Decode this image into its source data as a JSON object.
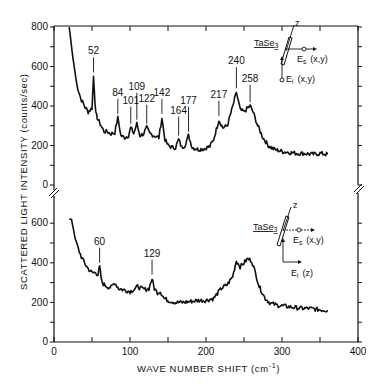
{
  "chart_data": {
    "type": "line",
    "title": "",
    "xlabel": "WAVE NUMBER SHIFT (cm⁻¹)",
    "ylabel": "SCATTERED LIGHT INTENSITY (counts/sec)",
    "xlim": [
      0,
      400
    ],
    "x_ticks": [
      0,
      100,
      200,
      300,
      400
    ],
    "grid": false,
    "legend": "none",
    "panels": [
      {
        "name": "top",
        "ylim": [
          0,
          800
        ],
        "y_ticks": [
          0,
          200,
          400,
          600,
          800
        ],
        "inset": {
          "sample": "TaSe3",
          "axis_label": "z",
          "scattered": "Es (x,y)",
          "incident": "Ei (x,y)"
        },
        "peak_labels": [
          52,
          84,
          101,
          109,
          122,
          142,
          164,
          177,
          217,
          240,
          258
        ],
        "series": {
          "name": "TaSe3 Ei(x,y) Es(x,y)",
          "x": [
            20,
            25,
            30,
            35,
            40,
            45,
            50,
            52,
            55,
            58,
            62,
            66,
            70,
            75,
            80,
            84,
            88,
            93,
            98,
            101,
            105,
            109,
            113,
            118,
            122,
            126,
            132,
            138,
            142,
            146,
            150,
            156,
            160,
            164,
            168,
            172,
            177,
            182,
            190,
            198,
            205,
            210,
            217,
            222,
            228,
            234,
            240,
            245,
            250,
            255,
            258,
            262,
            268,
            275,
            282,
            290,
            300,
            310,
            320,
            330,
            340,
            350,
            360
          ],
          "y": [
            800,
            640,
            510,
            440,
            400,
            370,
            390,
            550,
            360,
            330,
            300,
            270,
            270,
            260,
            265,
            340,
            250,
            240,
            250,
            290,
            260,
            310,
            250,
            260,
            290,
            260,
            250,
            240,
            340,
            230,
            200,
            190,
            190,
            230,
            190,
            200,
            250,
            190,
            180,
            185,
            195,
            230,
            330,
            290,
            300,
            380,
            470,
            380,
            370,
            390,
            400,
            370,
            300,
            240,
            200,
            180,
            170,
            165,
            160,
            160,
            155,
            160,
            155
          ]
        }
      },
      {
        "name": "bottom",
        "ylim": [
          0,
          600
        ],
        "y_ticks": [
          0,
          200,
          400,
          600
        ],
        "inset": {
          "sample": "TaSe3",
          "axis_label": "z",
          "scattered": "Es (x,y)",
          "incident": "Ei (z)"
        },
        "peak_labels": [
          60,
          129
        ],
        "series": {
          "name": "TaSe3 Ei(z) Es(x,y)",
          "x": [
            20,
            22,
            25,
            28,
            32,
            36,
            40,
            45,
            50,
            55,
            58,
            60,
            63,
            66,
            70,
            75,
            80,
            85,
            90,
            95,
            100,
            105,
            110,
            115,
            120,
            125,
            129,
            132,
            136,
            140,
            145,
            150,
            160,
            170,
            180,
            190,
            200,
            210,
            220,
            228,
            235,
            240,
            245,
            250,
            255,
            260,
            265,
            270,
            278,
            285,
            295,
            305,
            315,
            325,
            335,
            345,
            360
          ],
          "y": [
            700,
            640,
            580,
            520,
            470,
            430,
            400,
            370,
            350,
            350,
            340,
            380,
            300,
            290,
            280,
            275,
            300,
            270,
            265,
            260,
            255,
            265,
            280,
            270,
            265,
            270,
            320,
            270,
            250,
            255,
            220,
            210,
            200,
            200,
            205,
            210,
            210,
            220,
            270,
            290,
            330,
            410,
            380,
            400,
            420,
            410,
            350,
            280,
            220,
            195,
            185,
            180,
            175,
            170,
            170,
            165,
            160
          ]
        }
      }
    ]
  },
  "axes": {
    "y_title": "SCATTERED LIGHT INTENSITY  (counts/sec)",
    "x_title": "WAVE NUMBER SHIFT  (cm",
    "x_title_sup": "-1",
    "x_title_close": ")",
    "x_tick_labels": [
      "0",
      "100",
      "200",
      "300",
      "400"
    ],
    "top_y_tick_labels": [
      "800",
      "600",
      "400",
      "200",
      "0"
    ],
    "bottom_y_tick_labels": [
      "600",
      "400",
      "200",
      "0"
    ]
  },
  "top_inset": {
    "sample": "TaSe",
    "sample_sub": "3",
    "axis_z": "z",
    "es": "E",
    "es_sub": "s",
    "es_pol": "(x,y)",
    "ei": "E",
    "ei_sub": "i",
    "ei_pol": "(x,y)"
  },
  "bottom_inset": {
    "sample": "TaSe",
    "sample_sub": "3",
    "axis_z": "z",
    "es": "E",
    "es_sub": "s",
    "es_pol": "(x,y)",
    "ei": "E",
    "ei_sub": "i",
    "ei_pol": "(z)"
  },
  "peak_labels_top": [
    "52",
    "84",
    "101",
    "109",
    "122",
    "142",
    "164",
    "177",
    "217",
    "240",
    "258"
  ],
  "peak_labels_bottom": [
    "60",
    "129"
  ]
}
